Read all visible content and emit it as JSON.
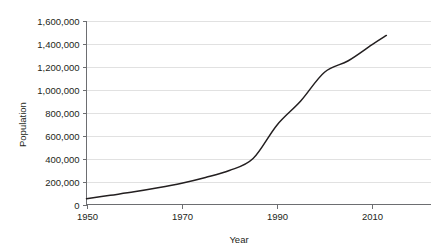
{
  "chart_data": {
    "type": "line",
    "title": "",
    "xlabel": "Year",
    "ylabel": "Population",
    "xlim": [
      1950,
      2013
    ],
    "ylim": [
      0,
      1600000
    ],
    "grid": true,
    "legend": false,
    "x_tick_labels": [
      "1950",
      "1970",
      "1990",
      "2010"
    ],
    "x_tick_values": [
      1950,
      1970,
      1990,
      2010
    ],
    "y_tick_labels": [
      "0",
      "200,000",
      "400,000",
      "600,000",
      "800,000",
      "1,000,000",
      "1,200,000",
      "1,400,000",
      "1,600,000"
    ],
    "y_tick_values": [
      0,
      200000,
      400000,
      600000,
      800000,
      1000000,
      1200000,
      1400000,
      1600000
    ],
    "series": [
      {
        "name": "Population",
        "color": "#231f20",
        "x": [
          1950,
          1955,
          1960,
          1965,
          1970,
          1975,
          1980,
          1985,
          1990,
          1995,
          2000,
          2005,
          2010,
          2013
        ],
        "values": [
          50000,
          80000,
          110000,
          145000,
          185000,
          235000,
          295000,
          400000,
          690000,
          900000,
          1150000,
          1250000,
          1390000,
          1470000
        ]
      }
    ]
  },
  "axis": {
    "y_title": "Population",
    "x_title": "Year"
  },
  "colors": {
    "line": "#231f20",
    "grid": "#d9d9d9",
    "axis": "#6d6e71",
    "background": "#ffffff"
  }
}
